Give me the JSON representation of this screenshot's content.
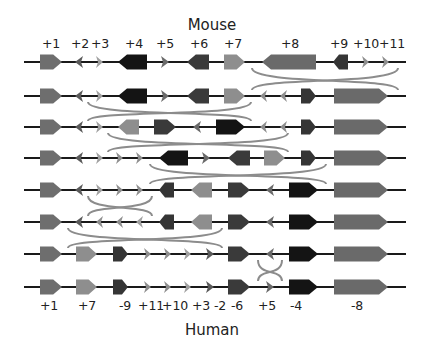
{
  "top_title": "Mouse",
  "bottom_title": "Human",
  "colors": {
    "line": "#1a1a1a",
    "arc": "#8c8c8c",
    "g1": "#6e6e6e",
    "g2": "#5a5a5a",
    "g3": "#a0a0a0",
    "g4": "#141414",
    "g5": "#6a6a6a",
    "g6": "#3a3a3a",
    "g7": "#8e8e8e",
    "g8": "#6a6a6a",
    "g9": "#353535",
    "g10": "#8e8e8e",
    "g11": "#8e8e8e"
  },
  "top_labels": [
    {
      "text": "+1",
      "x": 51
    },
    {
      "text": "+2",
      "x": 80
    },
    {
      "text": "+3",
      "x": 100
    },
    {
      "text": "+4",
      "x": 134
    },
    {
      "text": "+5",
      "x": 165
    },
    {
      "text": "+6",
      "x": 199
    },
    {
      "text": "+7",
      "x": 233
    },
    {
      "text": "+8",
      "x": 290
    },
    {
      "text": "+9",
      "x": 339
    },
    {
      "text": "+10",
      "x": 366
    },
    {
      "text": "+11",
      "x": 392
    }
  ],
  "bottom_labels": [
    {
      "text": "+1",
      "x": 49
    },
    {
      "text": "+7",
      "x": 87
    },
    {
      "text": "-9",
      "x": 125
    },
    {
      "text": "+11",
      "x": 151
    },
    {
      "text": "+10",
      "x": 175
    },
    {
      "text": "+3",
      "x": 201
    },
    {
      "text": "-2",
      "x": 220
    },
    {
      "text": "-6",
      "x": 237
    },
    {
      "text": "+5",
      "x": 267
    },
    {
      "text": "-4",
      "x": 296
    },
    {
      "text": "-8",
      "x": 357
    }
  ],
  "line": {
    "x1": 24,
    "x2": 406
  },
  "rows": [
    {
      "y": 62,
      "genes": [
        {
          "id": 1,
          "x1": 40,
          "x2": 62,
          "dir": "R",
          "size": "big"
        },
        {
          "id": 2,
          "x1": 75,
          "x2": 83,
          "dir": "L",
          "size": "small"
        },
        {
          "id": 3,
          "x1": 96,
          "x2": 103,
          "dir": "R",
          "size": "small"
        },
        {
          "id": 4,
          "x1": 118,
          "x2": 147,
          "dir": "L",
          "size": "big"
        },
        {
          "id": 5,
          "x1": 161,
          "x2": 169,
          "dir": "R",
          "size": "small"
        },
        {
          "id": 6,
          "x1": 187,
          "x2": 209,
          "dir": "L",
          "size": "big"
        },
        {
          "id": 7,
          "x1": 224,
          "x2": 245,
          "dir": "R",
          "size": "big"
        },
        {
          "id": 8,
          "x1": 262,
          "x2": 316,
          "dir": "L",
          "size": "big"
        },
        {
          "id": 9,
          "x1": 333,
          "x2": 348,
          "dir": "L",
          "size": "big"
        },
        {
          "id": 10,
          "x1": 362,
          "x2": 369,
          "dir": "R",
          "size": "small"
        },
        {
          "id": 11,
          "x1": 382,
          "x2": 389,
          "dir": "R",
          "size": "small"
        }
      ]
    },
    {
      "y": 96,
      "genes": [
        {
          "id": 1,
          "x1": 40,
          "x2": 62,
          "dir": "R",
          "size": "big"
        },
        {
          "id": 2,
          "x1": 75,
          "x2": 83,
          "dir": "L",
          "size": "small"
        },
        {
          "id": 3,
          "x1": 96,
          "x2": 103,
          "dir": "R",
          "size": "small"
        },
        {
          "id": 4,
          "x1": 118,
          "x2": 147,
          "dir": "L",
          "size": "big"
        },
        {
          "id": 5,
          "x1": 161,
          "x2": 169,
          "dir": "R",
          "size": "small"
        },
        {
          "id": 6,
          "x1": 187,
          "x2": 209,
          "dir": "L",
          "size": "big"
        },
        {
          "id": 7,
          "x1": 224,
          "x2": 245,
          "dir": "R",
          "size": "big"
        },
        {
          "id": 11,
          "x1": 260,
          "x2": 267,
          "dir": "L",
          "size": "small"
        },
        {
          "id": 10,
          "x1": 280,
          "x2": 287,
          "dir": "L",
          "size": "small"
        },
        {
          "id": 9,
          "x1": 301,
          "x2": 316,
          "dir": "R",
          "size": "big"
        },
        {
          "id": 8,
          "x1": 334,
          "x2": 388,
          "dir": "R",
          "size": "big"
        }
      ]
    },
    {
      "y": 127,
      "genes": [
        {
          "id": 1,
          "x1": 40,
          "x2": 62,
          "dir": "R",
          "size": "big"
        },
        {
          "id": 2,
          "x1": 75,
          "x2": 83,
          "dir": "L",
          "size": "small"
        },
        {
          "id": 3,
          "x1": 96,
          "x2": 103,
          "dir": "R",
          "size": "small"
        },
        {
          "id": 7,
          "x1": 118,
          "x2": 139,
          "dir": "L",
          "size": "big"
        },
        {
          "id": 6,
          "x1": 154,
          "x2": 176,
          "dir": "R",
          "size": "big"
        },
        {
          "id": 5,
          "x1": 193,
          "x2": 201,
          "dir": "L",
          "size": "small"
        },
        {
          "id": 4,
          "x1": 216,
          "x2": 245,
          "dir": "R",
          "size": "big"
        },
        {
          "id": 11,
          "x1": 260,
          "x2": 267,
          "dir": "L",
          "size": "small"
        },
        {
          "id": 10,
          "x1": 280,
          "x2": 287,
          "dir": "L",
          "size": "small"
        },
        {
          "id": 9,
          "x1": 301,
          "x2": 316,
          "dir": "R",
          "size": "big"
        },
        {
          "id": 8,
          "x1": 334,
          "x2": 388,
          "dir": "R",
          "size": "big"
        }
      ]
    },
    {
      "y": 158,
      "genes": [
        {
          "id": 1,
          "x1": 40,
          "x2": 62,
          "dir": "R",
          "size": "big"
        },
        {
          "id": 2,
          "x1": 75,
          "x2": 83,
          "dir": "L",
          "size": "small"
        },
        {
          "id": 3,
          "x1": 96,
          "x2": 103,
          "dir": "R",
          "size": "small"
        },
        {
          "id": 10,
          "x1": 116,
          "x2": 123,
          "dir": "R",
          "size": "small"
        },
        {
          "id": 11,
          "x1": 136,
          "x2": 143,
          "dir": "R",
          "size": "small"
        },
        {
          "id": 4,
          "x1": 159,
          "x2": 188,
          "dir": "L",
          "size": "big"
        },
        {
          "id": 5,
          "x1": 202,
          "x2": 210,
          "dir": "R",
          "size": "small"
        },
        {
          "id": 6,
          "x1": 228,
          "x2": 250,
          "dir": "L",
          "size": "big"
        },
        {
          "id": 7,
          "x1": 264,
          "x2": 285,
          "dir": "R",
          "size": "big"
        },
        {
          "id": 9,
          "x1": 301,
          "x2": 316,
          "dir": "R",
          "size": "big"
        },
        {
          "id": 8,
          "x1": 334,
          "x2": 388,
          "dir": "R",
          "size": "big"
        }
      ]
    },
    {
      "y": 190,
      "genes": [
        {
          "id": 1,
          "x1": 40,
          "x2": 62,
          "dir": "R",
          "size": "big"
        },
        {
          "id": 2,
          "x1": 75,
          "x2": 83,
          "dir": "L",
          "size": "small"
        },
        {
          "id": 3,
          "x1": 96,
          "x2": 103,
          "dir": "R",
          "size": "small"
        },
        {
          "id": 10,
          "x1": 116,
          "x2": 123,
          "dir": "R",
          "size": "small"
        },
        {
          "id": 11,
          "x1": 136,
          "x2": 143,
          "dir": "R",
          "size": "small"
        },
        {
          "id": 9,
          "x1": 159,
          "x2": 174,
          "dir": "L",
          "size": "big"
        },
        {
          "id": 7,
          "x1": 191,
          "x2": 212,
          "dir": "L",
          "size": "big"
        },
        {
          "id": 6,
          "x1": 228,
          "x2": 250,
          "dir": "R",
          "size": "big"
        },
        {
          "id": 5,
          "x1": 266,
          "x2": 274,
          "dir": "L",
          "size": "small"
        },
        {
          "id": 4,
          "x1": 289,
          "x2": 318,
          "dir": "R",
          "size": "big"
        },
        {
          "id": 8,
          "x1": 334,
          "x2": 388,
          "dir": "R",
          "size": "big"
        }
      ]
    },
    {
      "y": 222,
      "genes": [
        {
          "id": 1,
          "x1": 40,
          "x2": 62,
          "dir": "R",
          "size": "big"
        },
        {
          "id": 2,
          "x1": 75,
          "x2": 83,
          "dir": "L",
          "size": "small"
        },
        {
          "id": 11,
          "x1": 96,
          "x2": 103,
          "dir": "L",
          "size": "small"
        },
        {
          "id": 10,
          "x1": 116,
          "x2": 123,
          "dir": "L",
          "size": "small"
        },
        {
          "id": 3,
          "x1": 136,
          "x2": 143,
          "dir": "L",
          "size": "small"
        },
        {
          "id": 9,
          "x1": 159,
          "x2": 174,
          "dir": "L",
          "size": "big"
        },
        {
          "id": 7,
          "x1": 191,
          "x2": 212,
          "dir": "L",
          "size": "big"
        },
        {
          "id": 6,
          "x1": 228,
          "x2": 250,
          "dir": "R",
          "size": "big"
        },
        {
          "id": 5,
          "x1": 266,
          "x2": 274,
          "dir": "L",
          "size": "small"
        },
        {
          "id": 4,
          "x1": 289,
          "x2": 318,
          "dir": "R",
          "size": "big"
        },
        {
          "id": 8,
          "x1": 334,
          "x2": 388,
          "dir": "R",
          "size": "big"
        }
      ]
    },
    {
      "y": 254,
      "genes": [
        {
          "id": 1,
          "x1": 40,
          "x2": 62,
          "dir": "R",
          "size": "big"
        },
        {
          "id": 7,
          "x1": 76,
          "x2": 97,
          "dir": "R",
          "size": "big"
        },
        {
          "id": 9,
          "x1": 113,
          "x2": 128,
          "dir": "R",
          "size": "big"
        },
        {
          "id": 11,
          "x1": 144,
          "x2": 151,
          "dir": "R",
          "size": "small"
        },
        {
          "id": 10,
          "x1": 164,
          "x2": 171,
          "dir": "R",
          "size": "small"
        },
        {
          "id": 3,
          "x1": 184,
          "x2": 191,
          "dir": "R",
          "size": "small"
        },
        {
          "id": 2,
          "x1": 206,
          "x2": 214,
          "dir": "R",
          "size": "small"
        },
        {
          "id": 6,
          "x1": 228,
          "x2": 250,
          "dir": "R",
          "size": "big"
        },
        {
          "id": 5,
          "x1": 266,
          "x2": 274,
          "dir": "L",
          "size": "small"
        },
        {
          "id": 4,
          "x1": 289,
          "x2": 318,
          "dir": "R",
          "size": "big"
        },
        {
          "id": 8,
          "x1": 334,
          "x2": 388,
          "dir": "R",
          "size": "big"
        }
      ]
    },
    {
      "y": 287,
      "genes": [
        {
          "id": 1,
          "x1": 40,
          "x2": 62,
          "dir": "R",
          "size": "big"
        },
        {
          "id": 7,
          "x1": 76,
          "x2": 97,
          "dir": "R",
          "size": "big"
        },
        {
          "id": 9,
          "x1": 113,
          "x2": 128,
          "dir": "R",
          "size": "big"
        },
        {
          "id": 11,
          "x1": 144,
          "x2": 151,
          "dir": "R",
          "size": "small"
        },
        {
          "id": 10,
          "x1": 164,
          "x2": 171,
          "dir": "R",
          "size": "small"
        },
        {
          "id": 3,
          "x1": 184,
          "x2": 191,
          "dir": "R",
          "size": "small"
        },
        {
          "id": 2,
          "x1": 206,
          "x2": 214,
          "dir": "R",
          "size": "small"
        },
        {
          "id": 6,
          "x1": 228,
          "x2": 250,
          "dir": "R",
          "size": "big"
        },
        {
          "id": 5,
          "x1": 266,
          "x2": 274,
          "dir": "R",
          "size": "small"
        },
        {
          "id": 4,
          "x1": 289,
          "x2": 318,
          "dir": "R",
          "size": "big"
        },
        {
          "id": 8,
          "x1": 334,
          "x2": 388,
          "dir": "R",
          "size": "big"
        }
      ]
    }
  ],
  "inversions": [
    {
      "between": [
        0,
        1
      ],
      "x1": 252,
      "x2": 398
    },
    {
      "between": [
        1,
        2
      ],
      "x1": 88,
      "x2": 251
    },
    {
      "between": [
        2,
        3
      ],
      "x1": 108,
      "x2": 288
    },
    {
      "between": [
        3,
        4
      ],
      "x1": 150,
      "x2": 326
    },
    {
      "between": [
        4,
        5
      ],
      "x1": 88,
      "x2": 152
    },
    {
      "between": [
        5,
        6
      ],
      "x1": 68,
      "x2": 222
    },
    {
      "between": [
        6,
        7
      ],
      "x1": 258,
      "x2": 282
    }
  ]
}
